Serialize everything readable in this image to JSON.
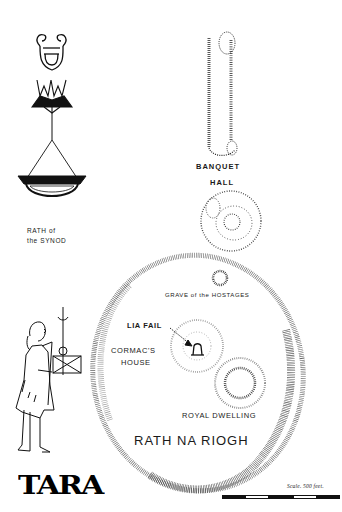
{
  "map": {
    "title": "TARA",
    "labels": {
      "banquet_hall_line1": "BANQUET",
      "banquet_hall_line2": "HALL",
      "rath_synod_line1": "RATH of",
      "rath_synod_line2": "the SYNOD",
      "grave_hostages": "GRAVE of the HOSTAGES",
      "lia_fail": "LIA FAIL",
      "cormacs_house_line1": "CORMAC'S",
      "cormacs_house_line2": "HOUSE",
      "royal_dwelling": "ROYAL DWELLING",
      "rath_na_riogh": "RATH NA RIOGH"
    },
    "scale": {
      "label": "Scale. 500 feet.",
      "segments": 5
    },
    "illustrations": [
      "lyre-icon",
      "lily-crown-icon",
      "hanging-lamp-icon",
      "standing-figure-with-scales-icon",
      "standing-stone-icon"
    ],
    "colors": {
      "ink": "#111111",
      "hatch": "#333333",
      "paper": "#ffffff"
    }
  }
}
